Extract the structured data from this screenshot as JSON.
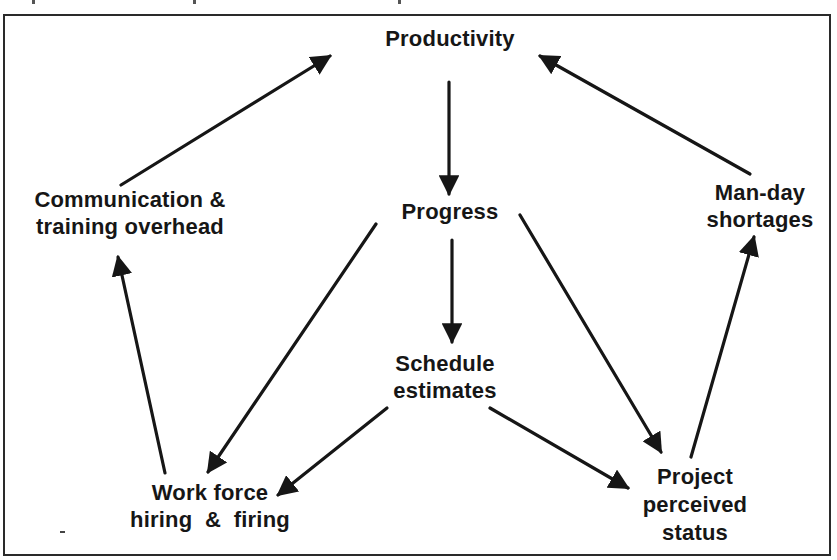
{
  "diagram": {
    "type": "causal-loop",
    "nodes": [
      {
        "id": "productivity",
        "lines": [
          "Productivity"
        ]
      },
      {
        "id": "progress",
        "lines": [
          "Progress"
        ]
      },
      {
        "id": "schedule_estimates",
        "lines": [
          "Schedule",
          "estimates"
        ]
      },
      {
        "id": "communication_overhead",
        "lines": [
          "Communication &",
          "training overhead"
        ]
      },
      {
        "id": "man_day_shortages",
        "lines": [
          "Man-day",
          "shortages"
        ]
      },
      {
        "id": "work_force",
        "lines": [
          "Work force",
          "hiring  &  firing"
        ]
      },
      {
        "id": "project_status",
        "lines": [
          "Project",
          "perceived",
          "status"
        ]
      }
    ],
    "edges": [
      {
        "from": "productivity",
        "to": "progress"
      },
      {
        "from": "progress",
        "to": "schedule_estimates"
      },
      {
        "from": "progress",
        "to": "work_force"
      },
      {
        "from": "progress",
        "to": "project_status"
      },
      {
        "from": "schedule_estimates",
        "to": "work_force"
      },
      {
        "from": "schedule_estimates",
        "to": "project_status"
      },
      {
        "from": "work_force",
        "to": "communication_overhead"
      },
      {
        "from": "communication_overhead",
        "to": "productivity"
      },
      {
        "from": "project_status",
        "to": "man_day_shortages"
      },
      {
        "from": "man_day_shortages",
        "to": "productivity"
      }
    ],
    "colors": {
      "ink": "#161616",
      "background": "#ffffff",
      "frame": "#2a2a2a"
    }
  }
}
